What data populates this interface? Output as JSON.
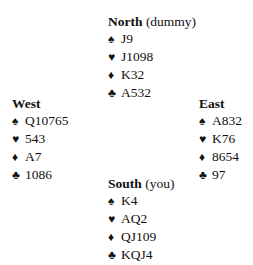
{
  "hands": {
    "north": {
      "name": "North",
      "note": "(dummy)",
      "spades": "J9",
      "hearts": "J1098",
      "diamonds": "K32",
      "clubs": "A532"
    },
    "west": {
      "name": "West",
      "spades": "Q10765",
      "hearts": "543",
      "diamonds": "A7",
      "clubs": "1086"
    },
    "east": {
      "name": "East",
      "spades": "A832",
      "hearts": "K76",
      "diamonds": "8654",
      "clubs": "97"
    },
    "south": {
      "name": "South",
      "note": "(you)",
      "spades": "K4",
      "hearts": "AQ2",
      "diamonds": "QJ109",
      "clubs": "KQJ4"
    }
  },
  "suit_symbols": {
    "spades": "♠",
    "hearts": "♥",
    "diamonds": "♦",
    "clubs": "♣"
  }
}
